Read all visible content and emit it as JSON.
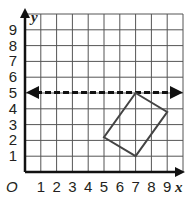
{
  "graph": {
    "x_axis_label": "x",
    "y_axis_label": "y",
    "origin_label": "O",
    "x_ticks": [
      "1",
      "2",
      "3",
      "4",
      "5",
      "6",
      "7",
      "8",
      "9"
    ],
    "y_ticks": [
      "1",
      "2",
      "3",
      "4",
      "5",
      "6",
      "7",
      "8",
      "9"
    ],
    "grid": {
      "x_min": 0,
      "x_max": 10,
      "y_min": 0,
      "y_max": 10,
      "step": 1
    },
    "line_of_reflection": {
      "type": "dashed",
      "equation": "y = 5",
      "arrows": "both"
    },
    "shape": {
      "type": "rectangle",
      "vertices": [
        [
          7,
          5
        ],
        [
          9,
          3.8
        ],
        [
          7,
          1
        ],
        [
          5,
          2.2
        ]
      ],
      "stroke": "#444444"
    },
    "colors": {
      "grid": "#555555",
      "axis": "#111111",
      "dashed_line": "#111111"
    }
  }
}
